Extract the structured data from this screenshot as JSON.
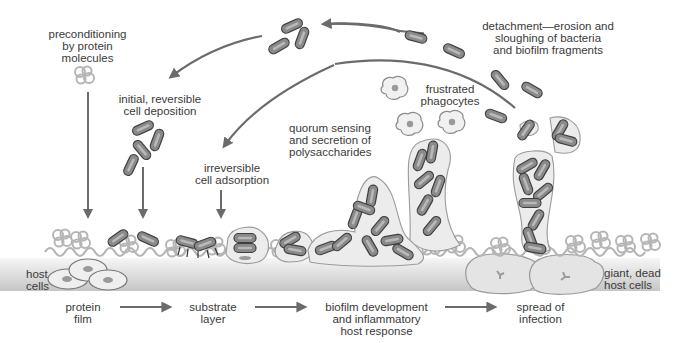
{
  "diagram": {
    "colors": {
      "arrow": "#6b6b6b",
      "bacterium_fill": "#8a8a8a",
      "bacterium_stroke": "#3f3f3f",
      "bacterium_core": "#b9b9b9",
      "matrix_fill": "#ececec",
      "matrix_stroke": "#9a9a9a",
      "protein_film": "#b8b8b8",
      "host_layer_top": "#f4f4f4",
      "host_layer_bottom": "#c9c9c9",
      "host_cell_fill": "#efefef",
      "host_cell_nucleus": "#9a9a9a",
      "text": "#3a3a3a"
    },
    "labels": {
      "preconditioning": [
        "preconditioning",
        "by protein",
        "molecules"
      ],
      "initial_deposition": [
        "initial, reversible",
        "cell deposition"
      ],
      "irreversible_adsorption": [
        "irreversible",
        "cell adsorption"
      ],
      "quorum_sensing": [
        "quorum sensing",
        "and secretion of",
        "polysaccharides"
      ],
      "frustrated_phagocytes": [
        "frustrated",
        "phagocytes"
      ],
      "detachment": [
        "detachment—erosion and",
        "sloughing of bacteria",
        "and biofilm fragments"
      ],
      "host_cells": [
        "host",
        "cells"
      ],
      "giant_dead_host_cells": [
        "giant, dead",
        "host cells"
      ]
    },
    "stages": [
      {
        "label": [
          "protein",
          "film"
        ]
      },
      {
        "label": [
          "substrate",
          "layer"
        ]
      },
      {
        "label": [
          "biofilm development",
          "and inflammatory",
          "host response"
        ]
      },
      {
        "label": [
          "spread of",
          "infection"
        ]
      }
    ]
  }
}
